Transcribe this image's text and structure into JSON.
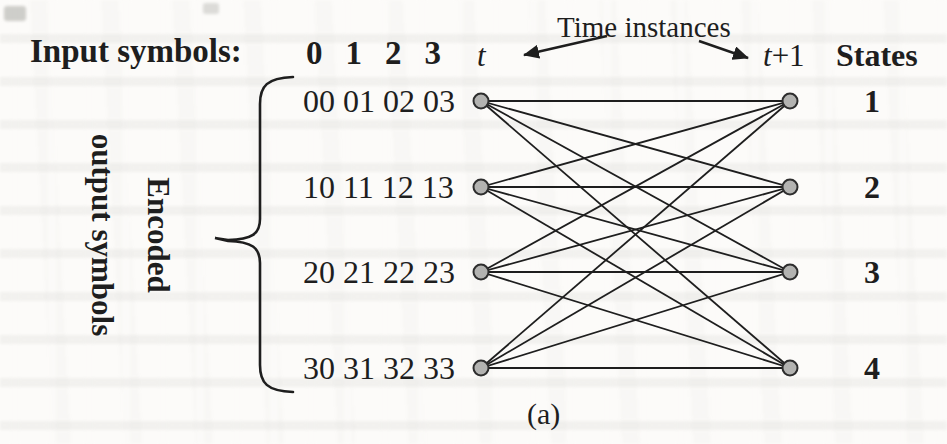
{
  "figure": {
    "input_symbols_label": "Input symbols:",
    "input_symbols": [
      "0",
      "1",
      "2",
      "3"
    ],
    "time_instances_label": "Time instances",
    "time_left": "t",
    "time_right_base": "t",
    "time_right_suffix": "+1",
    "states_label": "States",
    "encoded_label_line1": "Encoded",
    "encoded_label_line2": "output symbols",
    "caption": "(a)"
  },
  "rows": [
    {
      "encoded_outputs": "00 01 02 03",
      "state": "1"
    },
    {
      "encoded_outputs": "10 11 12 13",
      "state": "2"
    },
    {
      "encoded_outputs": "20 21 22 23",
      "state": "3"
    },
    {
      "encoded_outputs": "30 31 32 33",
      "state": "4"
    }
  ],
  "trellis": {
    "type": "complete-bipartite",
    "left_column_time": "t",
    "right_column_time": "t+1",
    "left_x": 481,
    "right_x": 790,
    "node_y": [
      101,
      187,
      272,
      368
    ],
    "node_radius": 7.5,
    "edges": [
      [
        1,
        1
      ],
      [
        1,
        2
      ],
      [
        1,
        3
      ],
      [
        1,
        4
      ],
      [
        2,
        1
      ],
      [
        2,
        2
      ],
      [
        2,
        3
      ],
      [
        2,
        4
      ],
      [
        3,
        1
      ],
      [
        3,
        2
      ],
      [
        3,
        3
      ],
      [
        3,
        4
      ],
      [
        4,
        1
      ],
      [
        4,
        2
      ],
      [
        4,
        3
      ],
      [
        4,
        4
      ]
    ]
  },
  "colors": {
    "ink": "#1e1e1e",
    "node_fill": "#b3b3b1",
    "node_stroke": "#2d2d2d",
    "paper": "#fcfbf9"
  }
}
